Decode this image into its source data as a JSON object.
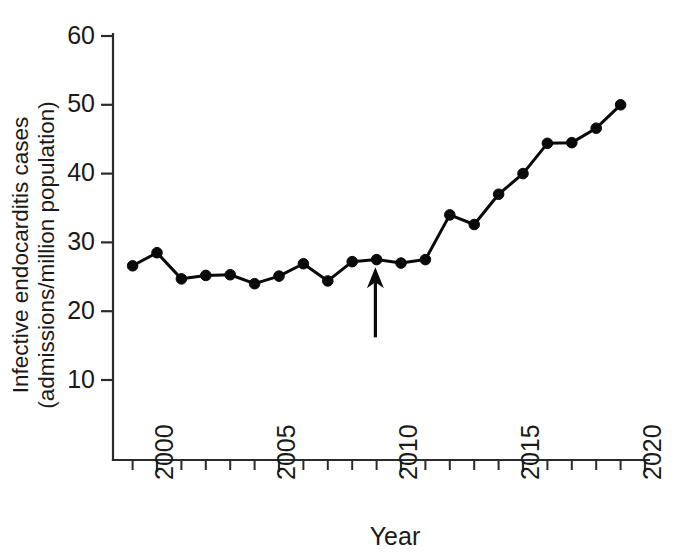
{
  "chart_data": {
    "type": "line",
    "title": "",
    "xlabel": "Year",
    "ylabel": "Infective endocarditis cases (admissions/million population)",
    "ylabel_line1": "Infective endocarditis cases",
    "ylabel_line2": "(admissions/million population)",
    "xlim": [
      1998.6,
      2020.2
    ],
    "ylim": [
      0,
      62
    ],
    "grid": false,
    "legend": null,
    "x_major_ticks": [
      2000,
      2005,
      2010,
      2015,
      2020
    ],
    "x_major_tick_labels": [
      "2000",
      "2005",
      "2010",
      "2015",
      "2020"
    ],
    "x_minor_ticks": [
      1999,
      2001,
      2002,
      2003,
      2004,
      2006,
      2007,
      2008,
      2009,
      2011,
      2012,
      2013,
      2014,
      2016,
      2017,
      2018,
      2019
    ],
    "y_ticks": [
      10,
      20,
      30,
      40,
      50,
      60
    ],
    "y_tick_labels": [
      "10",
      "20",
      "30",
      "40",
      "50",
      "60"
    ],
    "x": [
      1999,
      2000,
      2001,
      2002,
      2003,
      2004,
      2005,
      2006,
      2007,
      2008,
      2009,
      2010,
      2011,
      2012,
      2013,
      2014,
      2015,
      2016,
      2017,
      2018,
      2019
    ],
    "values": [
      26.6,
      28.5,
      24.7,
      25.2,
      25.3,
      24.0,
      25.1,
      26.9,
      24.4,
      27.2,
      27.5,
      27.0,
      27.5,
      34.0,
      32.6,
      37.0,
      40.0,
      44.4,
      44.5,
      46.6,
      50.0
    ],
    "series": [
      {
        "name": "Infective endocarditis admissions",
        "marker": "circle",
        "color": "#0a0a0a",
        "values": [
          26.6,
          28.5,
          24.7,
          25.2,
          25.3,
          24.0,
          25.1,
          26.9,
          24.4,
          27.2,
          27.5,
          27.0,
          27.5,
          34.0,
          32.6,
          37.0,
          40.0,
          44.4,
          44.5,
          46.6,
          50.0
        ]
      }
    ],
    "annotations": [
      {
        "name": "guideline-change-arrow",
        "type": "arrow",
        "x": 2008.95,
        "y_tip": 26.4,
        "y_base": 16.2,
        "label": "",
        "color": "#0a0a0a"
      }
    ]
  },
  "axes": {
    "x_axis_title": "Year",
    "y_axis_title_line1": "Infective endocarditis cases",
    "y_axis_title_line2": "(admissions/million population)"
  }
}
